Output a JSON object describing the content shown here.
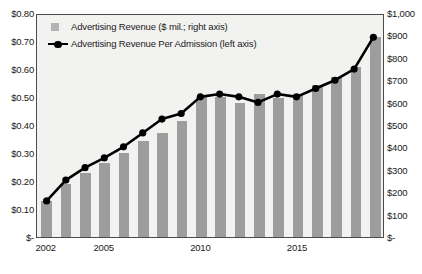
{
  "chart_data": {
    "type": "bar",
    "title": "",
    "xlabel": "",
    "ylabel": "",
    "grid": false,
    "legend_position": "top-left",
    "categories": [
      "2002",
      "2003",
      "2004",
      "2005",
      "2006",
      "2007",
      "2008",
      "2009",
      "2010",
      "2011",
      "2012",
      "2013",
      "2014",
      "2015",
      "2016",
      "2017",
      "2018",
      "2019"
    ],
    "x_tick_labels": [
      "2002",
      "2005",
      "2010",
      "2015"
    ],
    "x_tick_categories": [
      "2002",
      "2005",
      "2010",
      "2015"
    ],
    "left_axis": {
      "label": "Advertising Revenue Per Admission",
      "ticks": [
        "$0.80",
        "$0.70",
        "$0.60",
        "$0.50",
        "$0.40",
        "$0.30",
        "$0.20",
        "$0.10",
        "$-"
      ],
      "tick_values": [
        0.8,
        0.7,
        0.6,
        0.5,
        0.4,
        0.3,
        0.2,
        0.1,
        0
      ],
      "ylim": [
        0,
        0.8
      ]
    },
    "right_axis": {
      "label": "Advertising Revenue ($ mil.)",
      "ticks": [
        "$1,000",
        "$900",
        "$800",
        "$700",
        "$600",
        "$500",
        "$400",
        "$300",
        "$200",
        "$100",
        "$-"
      ],
      "tick_values": [
        1000,
        900,
        800,
        700,
        600,
        500,
        400,
        300,
        200,
        100,
        0
      ],
      "ylim": [
        0,
        1000
      ]
    },
    "series": [
      {
        "name": "Advertising Revenue ($ mil.; right axis)",
        "type": "bar",
        "axis": "right",
        "color": "#9d9d9d",
        "values": [
          160,
          235,
          285,
          330,
          375,
          430,
          465,
          520,
          625,
          625,
          600,
          640,
          620,
          640,
          680,
          715,
          760,
          895
        ]
      },
      {
        "name": "Advertising Revenue Per Admission (left axis)",
        "type": "line",
        "axis": "left",
        "color": "#000000",
        "values": [
          0.13,
          0.205,
          0.25,
          0.285,
          0.325,
          0.375,
          0.425,
          0.445,
          0.505,
          0.515,
          0.505,
          0.485,
          0.515,
          0.505,
          0.535,
          0.565,
          0.605,
          0.72
        ]
      }
    ]
  },
  "legend": {
    "items": [
      {
        "label": "Advertising Revenue ($ mil.; right axis)",
        "marker": "square"
      },
      {
        "label": "Advertising Revenue Per Admission (left axis)",
        "marker": "line-dot"
      }
    ]
  }
}
